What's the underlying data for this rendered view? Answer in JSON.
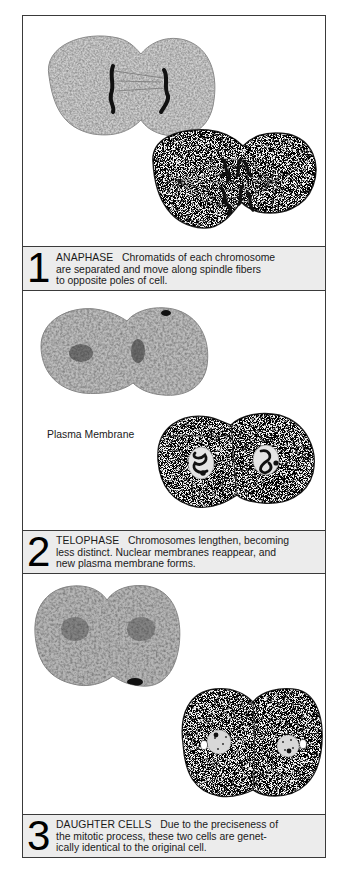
{
  "figure": {
    "panels": [
      {
        "number": "1",
        "phase": "ANAPHASE",
        "description_lines": [
          "Chromatids of each chromosome",
          "are separated and move along spindle fibers",
          "to opposite poles of cell."
        ],
        "images": [
          "micrograph-anaphase",
          "drawing-anaphase"
        ]
      },
      {
        "number": "2",
        "phase": "TELOPHASE",
        "description_lines": [
          "Chromosomes lengthen, becoming",
          "less distinct. Nuclear membranes reappear, and",
          "new plasma membrane forms."
        ],
        "label": "Plasma Membrane",
        "images": [
          "micrograph-telophase",
          "drawing-telophase"
        ]
      },
      {
        "number": "3",
        "phase": "DAUGHTER CELLS",
        "description_lines": [
          "Due to the preciseness of",
          "the mitotic process, these two cells are genet-",
          "ically identical to the original cell."
        ],
        "images": [
          "micrograph-daughter-cells",
          "drawing-daughter-cells"
        ]
      }
    ]
  },
  "colors": {
    "border": "#3a3a3a",
    "caption_bg": "#ececec",
    "text": "#1a1a1a"
  }
}
